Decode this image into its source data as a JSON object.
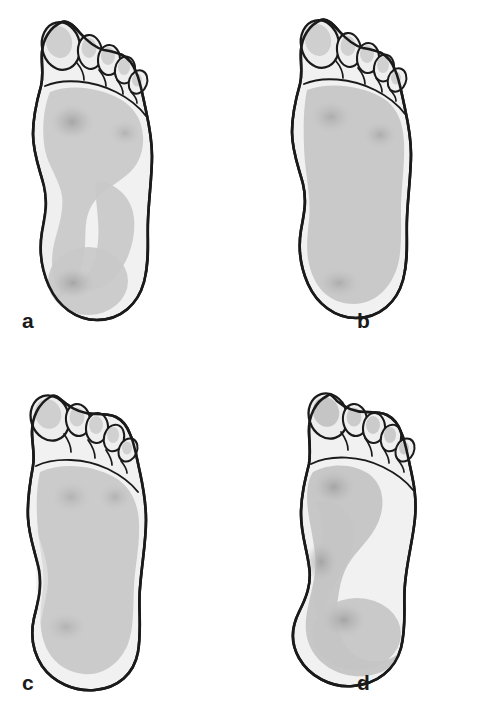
{
  "figure": {
    "background_color": "#ffffff",
    "panel_count": 4,
    "layout": "2 columns x 2 rows"
  },
  "palette": {
    "outline": "#1a1a1a",
    "skin_light": "#f2f2f2",
    "skin_shadow": "#e4e4e4",
    "toe_pad": "#c9c9c9",
    "load_light": "#d8d8d8",
    "load_mid": "#c6c6c6",
    "hotspot": "#ababab",
    "label_color": "#1a1a1a"
  },
  "panels": [
    {
      "id": "a",
      "label": "a",
      "side": "left",
      "arch_type": "normal arch",
      "description": "Normal foot: loaded forefoot and heel connected by a narrow lateral band; deep medial arch notch unloaded.",
      "medial_notch": true,
      "sole_fill_fraction": 0.62,
      "hotspots": [
        {
          "name": "first-metatarsal-head",
          "x": 72,
          "y": 122,
          "intensity": 0.85
        },
        {
          "name": "fifth-metatarsal-head",
          "x": 125,
          "y": 133,
          "intensity": 0.62
        },
        {
          "name": "heel-center",
          "x": 73,
          "y": 283,
          "intensity": 0.78
        }
      ]
    },
    {
      "id": "b",
      "label": "b",
      "side": "left",
      "arch_type": "flat foot (pes planus)",
      "description": "Flat foot: the entire sole contacts the ground, medial arch notch absent, full-width midfoot loading.",
      "medial_notch": false,
      "sole_fill_fraction": 0.95,
      "hotspots": [
        {
          "name": "first-metatarsal-head",
          "x": 82,
          "y": 117,
          "intensity": 0.7
        },
        {
          "name": "fifth-metatarsal-head",
          "x": 131,
          "y": 135,
          "intensity": 0.72
        },
        {
          "name": "heel-center",
          "x": 90,
          "y": 283,
          "intensity": 0.68
        }
      ]
    },
    {
      "id": "c",
      "label": "c",
      "side": "left",
      "arch_type": "lowered arch",
      "description": "Lowered arch: broad midfoot contact with only a shallow medial indentation; load spread evenly.",
      "medial_notch": false,
      "sole_fill_fraction": 0.9,
      "hotspots": [
        {
          "name": "first-metatarsal-head",
          "x": 71,
          "y": 135,
          "intensity": 0.66
        },
        {
          "name": "fifth-metatarsal-head",
          "x": 115,
          "y": 135,
          "intensity": 0.64
        },
        {
          "name": "heel-center",
          "x": 66,
          "y": 265,
          "intensity": 0.6
        }
      ]
    },
    {
      "id": "d",
      "label": "d",
      "side": "left",
      "arch_type": "high arch / supinated load pattern",
      "description": "Pressure concentrated along a narrow medial column from the first metatarsal head to the heel; lateral border unloaded.",
      "medial_notch": true,
      "sole_fill_fraction": 0.55,
      "hotspots": [
        {
          "name": "first-metatarsal-head",
          "x": 85,
          "y": 125,
          "intensity": 0.8
        },
        {
          "name": "medial-midfoot",
          "x": 72,
          "y": 200,
          "intensity": 0.6
        },
        {
          "name": "heel-center",
          "x": 95,
          "y": 258,
          "intensity": 0.82
        }
      ]
    }
  ]
}
